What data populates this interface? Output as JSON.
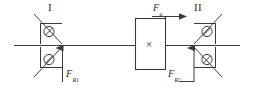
{
  "figure": {
    "background_color": "#ffffff",
    "line_color": "#3a3a3a",
    "text_color": "#2b2b2b"
  },
  "labels": {
    "bearing_unit_1": "I",
    "bearing_unit_2": "II",
    "axial_force": "F",
    "axial_force_sub": "a",
    "reaction_force_1": "F",
    "reaction_force_1_sub": "R1",
    "reaction_force_2": "F",
    "reaction_force_2_sub": "R2",
    "gear_symbol": "×"
  },
  "geometry": {
    "shaft": {
      "x1": 14,
      "y1": 45,
      "x2": 240,
      "y2": 45
    },
    "gearbox": {
      "x": 135,
      "y": 18,
      "width": 30,
      "height": 52
    },
    "axial_arrow": {
      "x1": 152,
      "y1": 16,
      "x2": 188,
      "y2": 16
    },
    "bearing_unit_1_center_x": 58,
    "bearing_unit_2_center_x": 196
  },
  "elements": {
    "shaft_line": "horizontal-shaft",
    "gearbox_rect": "gear-box",
    "gearbox_cross": "cross-symbol",
    "bearing_upper_left": "angular-contact-bearing-upper-left",
    "bearing_lower_left": "angular-contact-bearing-lower-left",
    "bearing_upper_right": "angular-contact-bearing-upper-right",
    "bearing_lower_right": "angular-contact-bearing-lower-right",
    "arrow_left": "reaction-force-arrow-left",
    "arrow_right": "reaction-force-arrow-right",
    "arrow_axial": "axial-force-arrow"
  }
}
